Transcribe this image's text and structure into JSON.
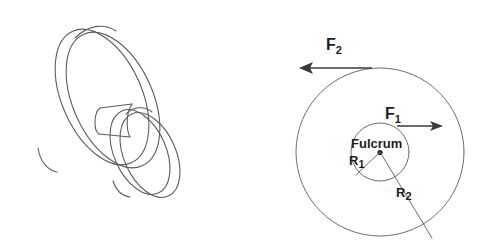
{
  "figure": {
    "background_color": "#ffffff",
    "line_color": "#5d5d5d",
    "label_color": "#1d1d1d",
    "arrow_color": "#3a3a3a"
  },
  "left_panel": {
    "name": "wheel-and-axle-3d-drawing",
    "description": "Three-dimensional line drawing of a wheel and axle: a large disc joined by a short cylindrical axle to a smaller disc"
  },
  "right_panel": {
    "name": "wheel-and-axle-schematic",
    "outer_circle": {
      "label": "",
      "center_x": 380,
      "center_y": 152,
      "radius": 84
    },
    "inner_circle": {
      "center_x": 380,
      "center_y": 152,
      "radius": 29
    },
    "fulcrum_label": "Fulcrum",
    "labels": {
      "force_1": "F",
      "force_1_sub": "1",
      "force_2": "F",
      "force_2_sub": "2",
      "radius_1": "R",
      "radius_1_sub": "1",
      "radius_2": "R",
      "radius_2_sub": "2"
    },
    "arrows": [
      {
        "name": "force-1-arrow",
        "label": "F1",
        "direction": "right",
        "x1": 398,
        "y1": 126,
        "x2": 441,
        "y2": 126
      },
      {
        "name": "force-2-arrow",
        "label": "F2",
        "direction": "left",
        "x1": 371,
        "y1": 68,
        "x2": 300,
        "y2": 68
      }
    ],
    "radius_lines": [
      {
        "name": "radius-1-line",
        "label": "R1",
        "from_x": 380,
        "from_y": 152,
        "to_x": 356,
        "to_y": 175
      },
      {
        "name": "radius-2-line",
        "label": "R2",
        "from_x": 380,
        "from_y": 152,
        "to_x": 432,
        "to_y": 238
      }
    ]
  }
}
